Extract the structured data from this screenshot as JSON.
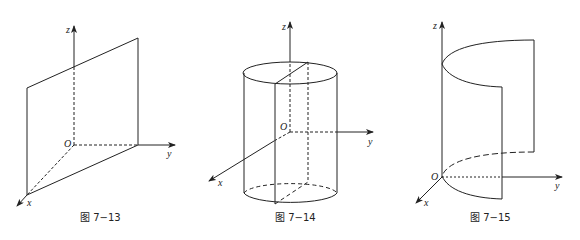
{
  "figures": [
    {
      "id": "fig-7-13",
      "caption": "图 7−13",
      "axes": {
        "x": "x",
        "y": "y",
        "z": "z",
        "origin": "O"
      },
      "shape": "plane"
    },
    {
      "id": "fig-7-14",
      "caption": "图 7−14",
      "axes": {
        "x": "x",
        "y": "y",
        "z": "z",
        "origin": "O"
      },
      "shape": "cylinder"
    },
    {
      "id": "fig-7-15",
      "caption": "图 7−15",
      "axes": {
        "x": "x",
        "y": "y",
        "z": "z",
        "origin": "O"
      },
      "shape": "parabolic-cylinder"
    }
  ],
  "colors": {
    "stroke": "#222222",
    "background": "#ffffff"
  }
}
